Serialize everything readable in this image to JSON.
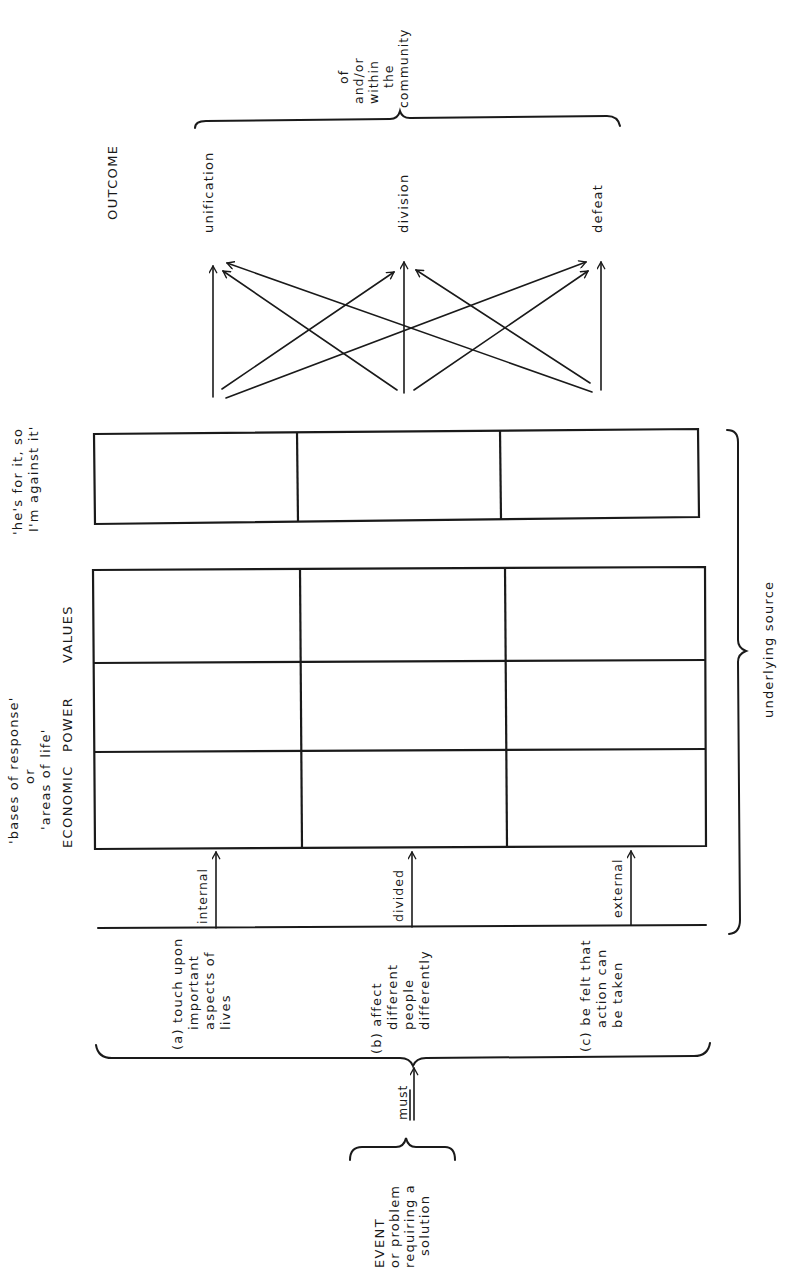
{
  "diagram": {
    "orientation": "rotated 90deg counter-clockwise (text reads bottom-to-top)",
    "colors": {
      "ink": "#1a1a1a",
      "background": "#ffffff"
    },
    "event": {
      "line1": "EVENT",
      "line2": "or problem",
      "line3": "requiring a",
      "line4": "solution"
    },
    "connector_label": "must",
    "conditions": [
      {
        "id": "a",
        "lines": [
          "(a) touch upon",
          "important",
          "aspects of",
          "lives"
        ],
        "arrow_label": "internal"
      },
      {
        "id": "b",
        "lines": [
          "(b) affect",
          "different",
          "people",
          "differently"
        ],
        "arrow_label": "divided"
      },
      {
        "id": "c",
        "lines": [
          "(c) be felt that",
          "action can",
          "be taken"
        ],
        "arrow_label": "external"
      }
    ],
    "bases": {
      "title_line1": "'bases of response'",
      "title_line2": "or",
      "title_line3": "'areas of life'",
      "columns": [
        "ECONOMIC",
        "POWER",
        "VALUES"
      ],
      "rows": 3
    },
    "personal": {
      "line1": "'he's for it, so",
      "line2": "I'm against it'",
      "rows": 3
    },
    "underlying_label": "underlying source",
    "outcome": {
      "title": "OUTCOME",
      "items": [
        "unification",
        "division",
        "defeat"
      ],
      "qualifier": [
        "of",
        "and/or",
        "within",
        "the",
        "community"
      ]
    }
  }
}
